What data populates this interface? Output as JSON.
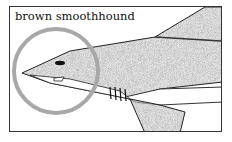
{
  "caption": "brown smoothhound",
  "illustration": {
    "subject": "shark-head-illustration",
    "highlight": "circle-around-snout"
  },
  "colors": {
    "frame": "#333333",
    "shark_fill": "#8a8a8a",
    "belly": "#ffffff",
    "highlight_circle": "#a8a8a8"
  }
}
